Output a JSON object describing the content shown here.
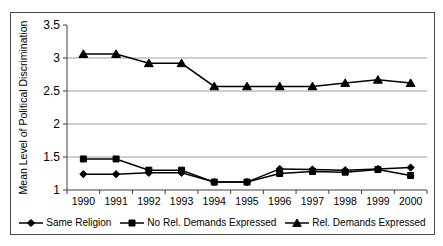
{
  "chart_data": {
    "type": "line",
    "title": "",
    "xlabel": "",
    "ylabel": "Mean Level of Political Discrimination",
    "categories": [
      "1990",
      "1991",
      "1992",
      "1993",
      "1994",
      "1995",
      "1996",
      "1997",
      "1998",
      "1999",
      "2000"
    ],
    "series": [
      {
        "name": "Same Religion",
        "marker": "diamond",
        "color": "#000000",
        "values": [
          1.24,
          1.24,
          1.26,
          1.26,
          1.12,
          1.12,
          1.32,
          1.31,
          1.3,
          1.32,
          1.34
        ]
      },
      {
        "name": "No Rel. Demands Expressed",
        "marker": "square",
        "color": "#000000",
        "values": [
          1.47,
          1.47,
          1.3,
          1.3,
          1.12,
          1.12,
          1.25,
          1.28,
          1.27,
          1.31,
          1.22
        ]
      },
      {
        "name": "Rel. Demands Expressed",
        "marker": "triangle",
        "color": "#000000",
        "values": [
          3.06,
          3.06,
          2.92,
          2.92,
          2.57,
          2.57,
          2.57,
          2.57,
          2.62,
          2.67,
          2.62
        ]
      }
    ],
    "ylim": [
      1,
      3.5
    ],
    "yticks": [
      1,
      1.5,
      2,
      2.5,
      3,
      3.5
    ],
    "gridlines_at": [
      1.5,
      2,
      2.5,
      3
    ],
    "grid": true,
    "legend_position": "bottom",
    "colors": {
      "line": "#000000",
      "grid": "#a0a0a0",
      "axis": "#404040",
      "frame": "#4a4a4a",
      "background": "#ffffff",
      "text": "#000000"
    }
  }
}
